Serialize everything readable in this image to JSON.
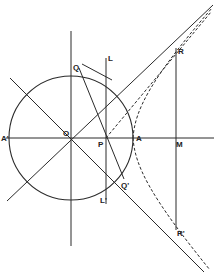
{
  "figure": {
    "colors": {
      "stroke": "#2a2a2a",
      "background": "#ffffff"
    },
    "circle": {
      "cx": 71,
      "cy": 138,
      "r": 62
    },
    "lines": [
      {
        "id": "horizontal-axis",
        "x1": 6,
        "y1": 138,
        "x2": 214,
        "y2": 138
      },
      {
        "id": "vertical-axis",
        "x1": 71,
        "y1": 31,
        "x2": 71,
        "y2": 246
      },
      {
        "id": "line-through-O-descending",
        "x1": 10,
        "y1": 78,
        "x2": 204,
        "y2": 272
      },
      {
        "id": "asymptote-ascending",
        "x1": 7,
        "y1": 201,
        "x2": 213,
        "y2": 5
      },
      {
        "id": "chord-Q-to-Qprime",
        "x1": 79,
        "y1": 68,
        "x2": 124,
        "y2": 179
      },
      {
        "id": "tangent-at-Q",
        "x1": 82,
        "y1": 64,
        "x2": 112,
        "y2": 80
      },
      {
        "id": "vertical-L-Lprime",
        "x1": 106,
        "y1": 58,
        "x2": 106,
        "y2": 204
      },
      {
        "id": "vertical-R-Rprime",
        "x1": 176,
        "y1": 48,
        "x2": 176,
        "y2": 230
      }
    ],
    "dashed": [
      {
        "id": "line-P-to-upper",
        "x1": 106,
        "y1": 138,
        "x2": 211,
        "y2": 12
      },
      {
        "id": "hyperbola-upper",
        "d": "M133,138 C135,110 150,80 212,8"
      },
      {
        "id": "hyperbola-lower",
        "d": "M133,138 C135,166 150,196 210,270"
      }
    ],
    "labels": [
      {
        "text": "Q",
        "x": 73,
        "y": 70
      },
      {
        "text": "L",
        "x": 108,
        "y": 61
      },
      {
        "text": "R",
        "x": 178,
        "y": 54
      },
      {
        "text": "A'",
        "x": 1,
        "y": 141
      },
      {
        "text": "O",
        "x": 63,
        "y": 136
      },
      {
        "text": "P",
        "x": 98,
        "y": 147
      },
      {
        "text": "A",
        "x": 136,
        "y": 141
      },
      {
        "text": "M",
        "x": 176,
        "y": 147
      },
      {
        "text": "Q'",
        "x": 121,
        "y": 188
      },
      {
        "text": "L'",
        "x": 100,
        "y": 203
      },
      {
        "text": "R'",
        "x": 177,
        "y": 236
      }
    ]
  }
}
